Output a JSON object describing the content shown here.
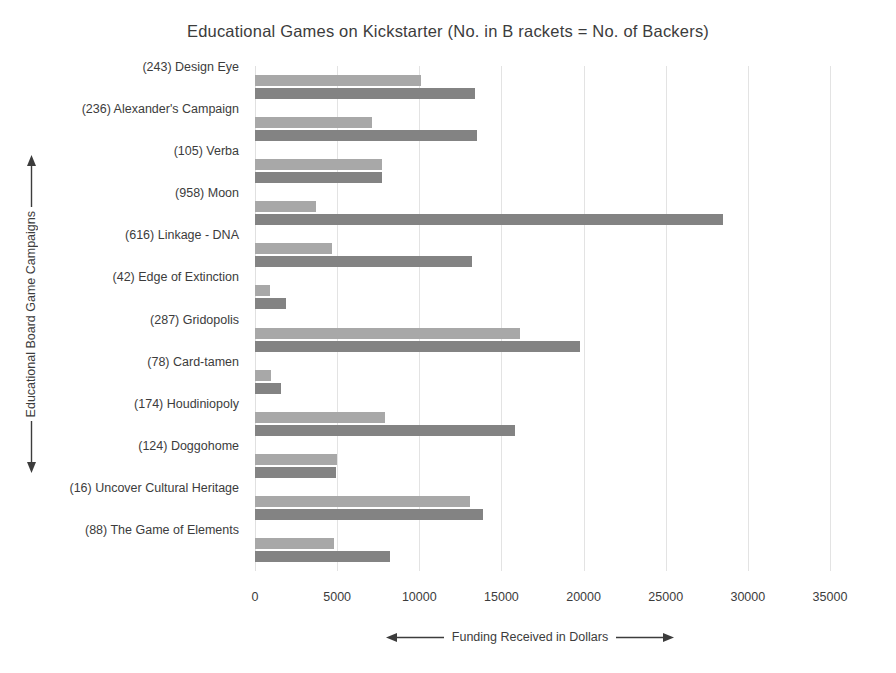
{
  "chart_data": {
    "type": "bar",
    "orientation": "horizontal",
    "title": "Educational  Games on Kickstarter (No. in B rackets = No. of Backers)",
    "xlabel": "Funding Received in Dollars",
    "ylabel": "Educational Board Game Campaigns",
    "xlim": [
      0,
      35000
    ],
    "xticks": [
      0,
      5000,
      10000,
      15000,
      20000,
      25000,
      30000,
      35000
    ],
    "xtick_labels": [
      "0",
      "5000",
      "10000",
      "15000",
      "20000",
      "25000",
      "30000",
      "35000"
    ],
    "grid": true,
    "legend": "none",
    "categories": [
      "(243) Design Eye",
      "(236) Alexander's Campaign",
      "(105) Verba",
      "(958) Moon",
      "(616) Linkage - DNA",
      "(42) Edge of Extinction",
      "(287) Gridopolis",
      "(78) Card-tamen",
      "(174) Houdiniopoly",
      "(124) Doggohome",
      "(16) Uncover Cultural Heritage",
      "(88) The Game of Elements"
    ],
    "series": [
      {
        "name": "light-gray-series",
        "color": "#a8a8a8",
        "values": [
          10100,
          7100,
          7700,
          3700,
          4700,
          900,
          16100,
          1000,
          7900,
          5000,
          13100,
          4800
        ]
      },
      {
        "name": "dark-gray-series",
        "color": "#838383",
        "values": [
          13400,
          13500,
          7700,
          28500,
          13200,
          1900,
          19800,
          1600,
          15800,
          4900,
          13900,
          8200
        ]
      }
    ],
    "backers": {
      "(243) Design Eye": 243,
      "(236) Alexander's Campaign": 236,
      "(105) Verba": 105,
      "(958) Moon": 958,
      "(616) Linkage - DNA": 616,
      "(42) Edge of Extinction": 42,
      "(287) Gridopolis": 287,
      "(78) Card-tamen": 78,
      "(174) Houdiniopoly": 174,
      "(124) Doggohome": 124,
      "(16) Uncover Cultural Heritage": 16,
      "(88) The Game of Elements": 88
    }
  },
  "colors": {
    "series_light": "#a8a8a8",
    "series_dark": "#838383",
    "grid": "#e3e3e3",
    "text": "#3c3c3c",
    "background": "#ffffff"
  }
}
